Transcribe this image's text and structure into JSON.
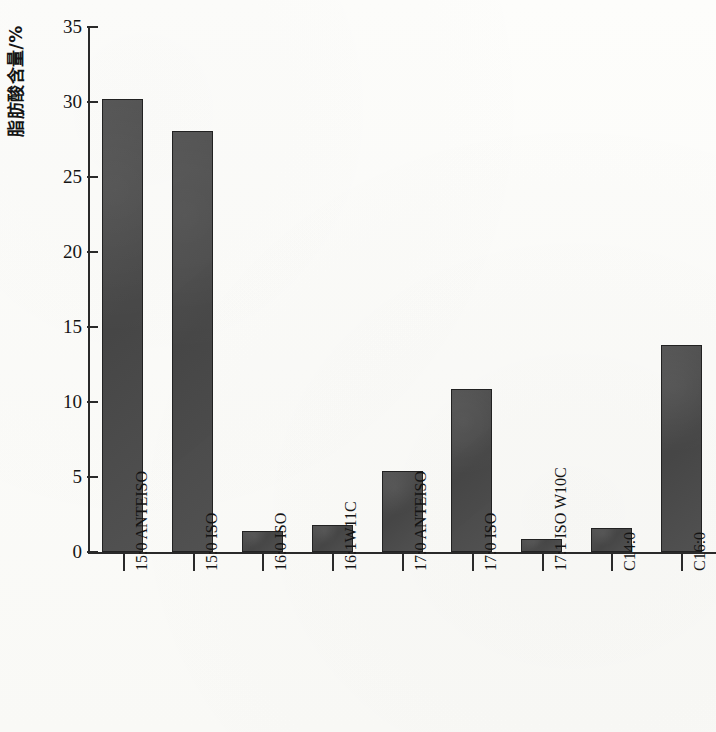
{
  "chart_data": {
    "type": "bar",
    "title": "",
    "xlabel": "",
    "ylabel": "脂肪酸含量/%",
    "ylim": [
      0,
      35
    ],
    "ytick_step": 5,
    "ytick_labels": [
      "0",
      "5",
      "10",
      "15",
      "20",
      "25",
      "30",
      "35"
    ],
    "grid": false,
    "legend": false,
    "categories": [
      "15:0 ANTEISO",
      "15:0 ISO",
      "16:0 ISO",
      "16:1W11C",
      "17:0 ANTEISO",
      "17:0 ISO",
      "17:1 ISO W10C",
      "C14:0",
      "C16:0"
    ],
    "values": [
      30.2,
      28.1,
      1.4,
      1.8,
      5.4,
      10.9,
      0.9,
      1.6,
      13.8
    ],
    "series": [
      {
        "name": "脂肪酸含量",
        "values": [
          30.2,
          28.1,
          1.4,
          1.8,
          5.4,
          10.9,
          0.9,
          1.6,
          13.8
        ]
      }
    ]
  },
  "style": {
    "bar_fill": "#4a4a4a",
    "bar_edge": "#222222",
    "axis_color": "#2a2a2a",
    "background": "#fbfbf8",
    "text_color": "#141414"
  }
}
